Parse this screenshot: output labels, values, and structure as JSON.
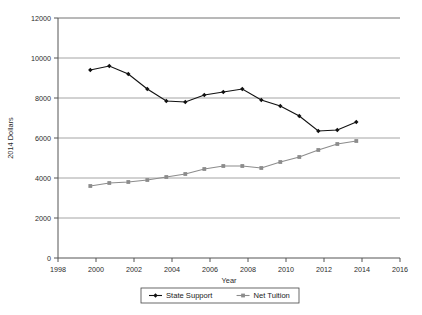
{
  "chart_data": {
    "type": "line",
    "title": "",
    "xlabel": "Year",
    "ylabel": "2014 Dollars",
    "xlim": [
      1998,
      2016
    ],
    "ylim": [
      0,
      12000
    ],
    "xticks": [
      1998,
      2000,
      2002,
      2004,
      2006,
      2008,
      2010,
      2012,
      2014,
      2016
    ],
    "yticks": [
      0,
      2000,
      4000,
      6000,
      8000,
      10000,
      12000
    ],
    "grid": "horizontal",
    "legend_position": "bottom",
    "x": [
      1999.7,
      2000.7,
      2001.7,
      2002.7,
      2003.7,
      2004.7,
      2005.7,
      2006.7,
      2007.7,
      2008.7,
      2009.7,
      2010.7,
      2011.7,
      2012.7,
      2013.7
    ],
    "series": [
      {
        "name": "State Support",
        "color": "#111111",
        "marker": "diamond",
        "values": [
          9400,
          9600,
          9200,
          8450,
          7850,
          7800,
          8150,
          8300,
          8450,
          7900,
          7600,
          7100,
          6350,
          6400,
          6800
        ]
      },
      {
        "name": "Net Tuition",
        "color": "#8c8c8c",
        "marker": "square",
        "values": [
          3600,
          3750,
          3800,
          3900,
          4050,
          4200,
          4450,
          4600,
          4600,
          4500,
          4800,
          5050,
          5400,
          5700,
          5850
        ]
      }
    ]
  },
  "legend": {
    "entries": [
      {
        "label": "State Support"
      },
      {
        "label": "Net Tuition"
      }
    ]
  },
  "axes": {
    "y_title": "2014 Dollars",
    "x_title": "Year"
  },
  "colors": {
    "series_state_support": "#111111",
    "series_net_tuition": "#8c8c8c",
    "gridline": "#9a9a9a",
    "axis": "#555555",
    "background": "#ffffff"
  }
}
